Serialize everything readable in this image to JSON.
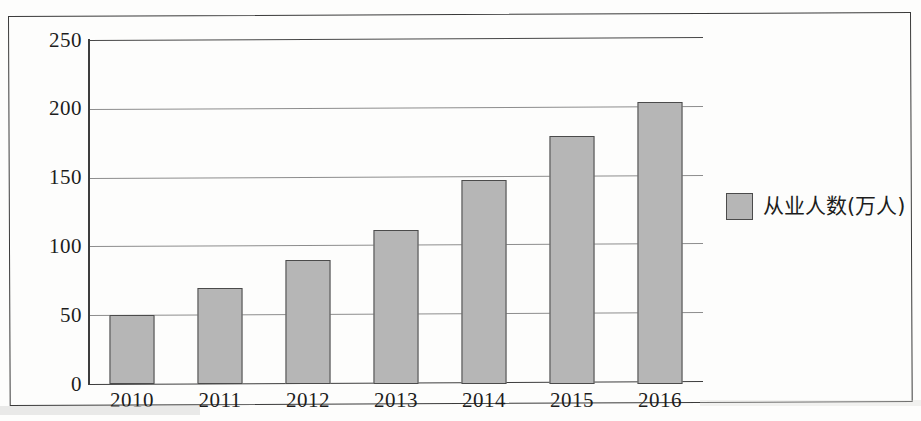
{
  "chart_data": {
    "type": "bar",
    "title": "",
    "subtitle": "",
    "xlabel": "",
    "ylabel": "",
    "categories": [
      "2010",
      "2011",
      "2012",
      "2013",
      "2014",
      "2015",
      "2016"
    ],
    "values": [
      50,
      70,
      90,
      112,
      148,
      180,
      205
    ],
    "series": [
      {
        "name": "从业人数(万人)",
        "values": [
          50,
          70,
          90,
          112,
          148,
          180,
          205
        ]
      }
    ],
    "ylim": [
      0,
      250
    ],
    "yticks": [
      "0",
      "50",
      "100",
      "150",
      "200",
      "250"
    ],
    "ytick_values": [
      0,
      50,
      100,
      150,
      200,
      250
    ],
    "grid": true,
    "grid_axis": "y",
    "legend": {
      "position": "right",
      "entries": [
        "从业人数(万人)"
      ]
    },
    "colors": {
      "bar_fill": "#b6b6b6",
      "bar_border": "#4b4b4b",
      "gridline": "#8d8d8d",
      "axis": "#3d3d3d",
      "text": "#1d1d1d",
      "frame": "#3a3a3a",
      "background": "#ffffff"
    }
  },
  "legend": {
    "swatch_name": "legend-color-swatch",
    "label": "从业人数(万人)"
  },
  "axes": {
    "y_ticks": [
      {
        "label": "250",
        "value": 250
      },
      {
        "label": "200",
        "value": 200
      },
      {
        "label": "150",
        "value": 150
      },
      {
        "label": "100",
        "value": 100
      },
      {
        "label": "50",
        "value": 50
      },
      {
        "label": "0",
        "value": 0
      }
    ],
    "x_ticks": [
      {
        "label": "2010"
      },
      {
        "label": "2011"
      },
      {
        "label": "2012"
      },
      {
        "label": "2013"
      },
      {
        "label": "2014"
      },
      {
        "label": "2015"
      },
      {
        "label": "2016"
      }
    ]
  }
}
